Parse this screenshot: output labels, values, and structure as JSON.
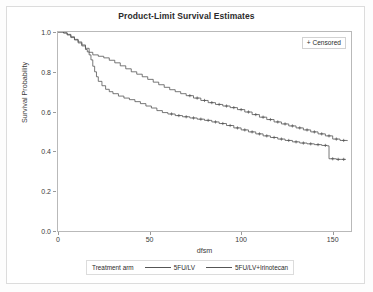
{
  "chart_data": {
    "type": "line",
    "title": "Product-Limit Survival Estimates",
    "xlabel": "dfsm",
    "ylabel": "Survival Probability",
    "xlim": [
      0,
      160
    ],
    "ylim": [
      0.0,
      1.0
    ],
    "xticks": [
      0,
      50,
      100,
      150
    ],
    "yticks": [
      "0.0",
      "0.2",
      "0.4",
      "0.6",
      "0.8",
      "1.0"
    ],
    "grid": false,
    "legend_position": "bottom",
    "legend_title": "Treatment arm",
    "censor_marker_label": "+ Censored",
    "censor_marker_symbol": "+",
    "series": [
      {
        "name": "5FU/LV",
        "color": "#555555",
        "points": [
          [
            0,
            1.0
          ],
          [
            3,
            0.995
          ],
          [
            5,
            0.985
          ],
          [
            7,
            0.972
          ],
          [
            9,
            0.96
          ],
          [
            11,
            0.945
          ],
          [
            13,
            0.93
          ],
          [
            15,
            0.912
          ],
          [
            16,
            0.9
          ],
          [
            17,
            0.885
          ],
          [
            18,
            0.86
          ],
          [
            19,
            0.828
          ],
          [
            20,
            0.8
          ],
          [
            21,
            0.775
          ],
          [
            22,
            0.752
          ],
          [
            24,
            0.73
          ],
          [
            26,
            0.712
          ],
          [
            28,
            0.7
          ],
          [
            30,
            0.69
          ],
          [
            33,
            0.678
          ],
          [
            36,
            0.668
          ],
          [
            39,
            0.66
          ],
          [
            42,
            0.65
          ],
          [
            45,
            0.64
          ],
          [
            48,
            0.628
          ],
          [
            51,
            0.618
          ],
          [
            54,
            0.605
          ],
          [
            57,
            0.595
          ],
          [
            60,
            0.588
          ],
          [
            64,
            0.58
          ],
          [
            68,
            0.574
          ],
          [
            72,
            0.568
          ],
          [
            76,
            0.562
          ],
          [
            80,
            0.556
          ],
          [
            84,
            0.548
          ],
          [
            88,
            0.54
          ],
          [
            92,
            0.53
          ],
          [
            96,
            0.518
          ],
          [
            100,
            0.508
          ],
          [
            104,
            0.498
          ],
          [
            108,
            0.488
          ],
          [
            112,
            0.478
          ],
          [
            116,
            0.47
          ],
          [
            120,
            0.462
          ],
          [
            124,
            0.455
          ],
          [
            128,
            0.448
          ],
          [
            132,
            0.442
          ],
          [
            136,
            0.438
          ],
          [
            140,
            0.434
          ],
          [
            144,
            0.43
          ],
          [
            147,
            0.428
          ],
          [
            148,
            0.363
          ],
          [
            152,
            0.36
          ],
          [
            157,
            0.358
          ]
        ],
        "censored_x": [
          62,
          66,
          70,
          74,
          78,
          82,
          86,
          90,
          94,
          98,
          102,
          106,
          110,
          114,
          118,
          122,
          126,
          130,
          134,
          138,
          142,
          146,
          150,
          153,
          156
        ]
      },
      {
        "name": "5FU/LV+Irinotecan",
        "color": "#555555",
        "points": [
          [
            0,
            1.0
          ],
          [
            3,
            0.996
          ],
          [
            5,
            0.988
          ],
          [
            7,
            0.976
          ],
          [
            9,
            0.963
          ],
          [
            11,
            0.95
          ],
          [
            13,
            0.935
          ],
          [
            15,
            0.918
          ],
          [
            17,
            0.898
          ],
          [
            19,
            0.885
          ],
          [
            22,
            0.878
          ],
          [
            25,
            0.87
          ],
          [
            28,
            0.858
          ],
          [
            31,
            0.845
          ],
          [
            34,
            0.83
          ],
          [
            37,
            0.815
          ],
          [
            40,
            0.8
          ],
          [
            43,
            0.788
          ],
          [
            46,
            0.775
          ],
          [
            49,
            0.762
          ],
          [
            52,
            0.748
          ],
          [
            55,
            0.735
          ],
          [
            58,
            0.722
          ],
          [
            61,
            0.71
          ],
          [
            64,
            0.7
          ],
          [
            67,
            0.69
          ],
          [
            70,
            0.68
          ],
          [
            74,
            0.668
          ],
          [
            78,
            0.656
          ],
          [
            82,
            0.645
          ],
          [
            86,
            0.636
          ],
          [
            90,
            0.628
          ],
          [
            94,
            0.62
          ],
          [
            98,
            0.61
          ],
          [
            102,
            0.598
          ],
          [
            106,
            0.585
          ],
          [
            110,
            0.572
          ],
          [
            114,
            0.56
          ],
          [
            118,
            0.548
          ],
          [
            122,
            0.538
          ],
          [
            126,
            0.528
          ],
          [
            130,
            0.518
          ],
          [
            134,
            0.508
          ],
          [
            138,
            0.498
          ],
          [
            142,
            0.488
          ],
          [
            146,
            0.478
          ],
          [
            150,
            0.462
          ],
          [
            154,
            0.455
          ],
          [
            158,
            0.452
          ]
        ],
        "censored_x": [
          72,
          76,
          80,
          84,
          88,
          92,
          96,
          100,
          104,
          108,
          112,
          116,
          120,
          124,
          128,
          132,
          136,
          140,
          144,
          148,
          152,
          156
        ]
      }
    ]
  },
  "legend": {
    "title": "Treatment arm",
    "entries": [
      {
        "label": "5FU/LV"
      },
      {
        "label": "5FU/LV+Irinotecan"
      }
    ]
  },
  "censored_box": {
    "label": "+ Censored"
  }
}
